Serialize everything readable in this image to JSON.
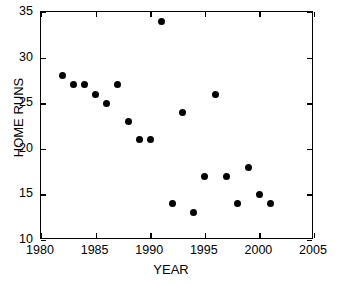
{
  "chart_data": {
    "type": "scatter",
    "title": "",
    "xlabel": "YEAR",
    "ylabel": "HOME RUNS",
    "xlim": [
      1980,
      2005
    ],
    "ylim": [
      10,
      35
    ],
    "xticks": [
      1980,
      1985,
      1990,
      1995,
      2000,
      2005
    ],
    "xticklabels": [
      "1980",
      "1985",
      "1990",
      "1995",
      "2000",
      "2005"
    ],
    "yticks": [
      10,
      15,
      20,
      25,
      30,
      35
    ],
    "yticklabels": [
      "10",
      "15",
      "20",
      "25",
      "30",
      "35"
    ],
    "grid": false,
    "legend": null,
    "marker": "filled-circle",
    "marker_color": "#000000",
    "x": [
      1982,
      1983,
      1984,
      1985,
      1986,
      1987,
      1988,
      1989,
      1990,
      1991,
      1992,
      1993,
      1994,
      1995,
      1996,
      1997,
      1998,
      1999,
      2000,
      2001
    ],
    "y": [
      28,
      27,
      27,
      26,
      25,
      27,
      23,
      21,
      21,
      34,
      14,
      24,
      13,
      17,
      26,
      17,
      14,
      18,
      15,
      14
    ],
    "points": [
      {
        "x": 1982,
        "y": 28
      },
      {
        "x": 1983,
        "y": 27
      },
      {
        "x": 1984,
        "y": 27
      },
      {
        "x": 1985,
        "y": 26
      },
      {
        "x": 1986,
        "y": 25
      },
      {
        "x": 1987,
        "y": 27
      },
      {
        "x": 1988,
        "y": 23
      },
      {
        "x": 1989,
        "y": 21
      },
      {
        "x": 1990,
        "y": 21
      },
      {
        "x": 1991,
        "y": 34
      },
      {
        "x": 1992,
        "y": 14
      },
      {
        "x": 1993,
        "y": 24
      },
      {
        "x": 1994,
        "y": 13
      },
      {
        "x": 1995,
        "y": 17
      },
      {
        "x": 1996,
        "y": 26
      },
      {
        "x": 1997,
        "y": 17
      },
      {
        "x": 1998,
        "y": 14
      },
      {
        "x": 1999,
        "y": 18
      },
      {
        "x": 2000,
        "y": 15
      },
      {
        "x": 2001,
        "y": 14
      }
    ]
  }
}
